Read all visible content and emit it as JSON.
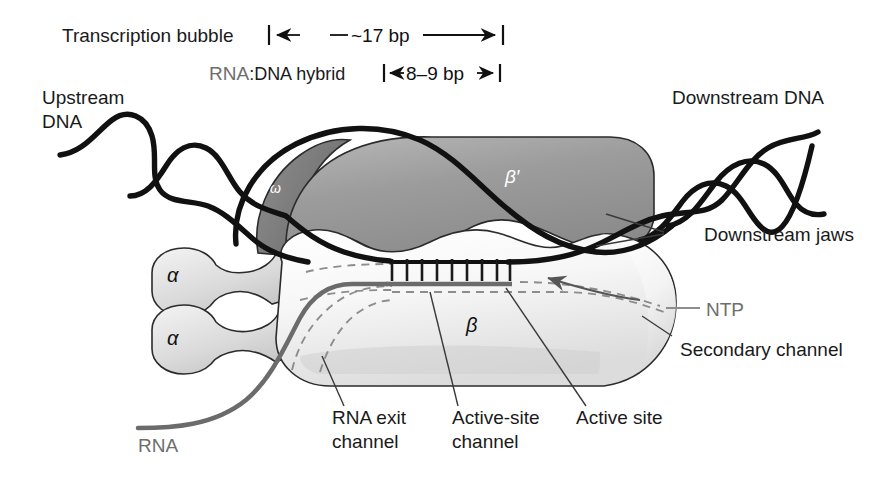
{
  "figure": {
    "background_color": "#ffffff"
  },
  "dimensions": {
    "transcription_bubble_label": "Transcription bubble",
    "transcription_bubble_value": "~17 bp",
    "hybrid_label_prefix": "RNA",
    "hybrid_label_rest": ":DNA hybrid",
    "hybrid_value": "8–9 bp"
  },
  "dna": {
    "upstream_line1": "Upstream",
    "upstream_line2": "DNA",
    "downstream": "Downstream DNA",
    "strand_color": "#111111"
  },
  "rna": {
    "label": "RNA",
    "strand_color": "#6b6b6b"
  },
  "subunits": {
    "alpha_top": "α",
    "alpha_bottom": "α",
    "omega": "ω",
    "beta_prime": "β′",
    "beta": "β",
    "beta_color": "#f2f2f2",
    "beta_prime_color": "#9a9a9a",
    "omega_color": "#7a7a7a",
    "alpha_color": "#d8d8d8"
  },
  "annotations": {
    "downstream_jaws": "Downstream jaws",
    "ntp": "NTP",
    "secondary_channel": "Secondary channel",
    "rna_exit_channel_line1": "RNA exit",
    "rna_exit_channel_line2": "channel",
    "active_site_channel_line1": "Active-site",
    "active_site_channel_line2": "channel",
    "active_site": "Active site"
  },
  "hybrid_ladder": {
    "rung_count": 9,
    "rung_x_start": 390,
    "rung_x_end": 508,
    "template_strand_color": "#111111",
    "rna_strand_color": "#6b6b6b"
  },
  "colors": {
    "leader_line": "#3a3a3a",
    "dashed_channel": "#8d8d8d",
    "ntp_leader": "#8d8d8d",
    "outline": "#2b2b2b"
  }
}
